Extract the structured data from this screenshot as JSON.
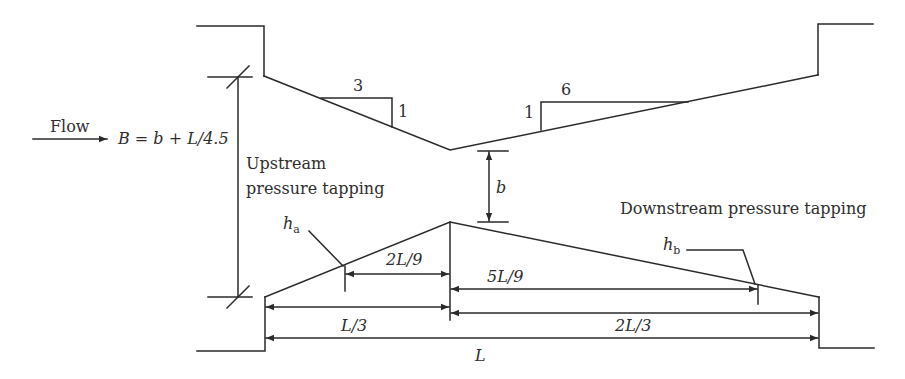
{
  "diagram": {
    "type": "Venturi flume / broad-crested weir profile",
    "stroke_color": "#2a2a2a",
    "text_color": "#2e2e2e",
    "background": "#ffffff"
  },
  "labels": {
    "flow": "Flow",
    "width_formula": "B = b + L/4.5",
    "upstream_line1": "Upstream",
    "upstream_line2": "pressure tapping",
    "downstream": "Downstream pressure tapping",
    "throat_width": "b",
    "ha_main": "h",
    "ha_sub": "a",
    "hb_main": "h",
    "hb_sub": "b"
  },
  "slopes": {
    "upstream": {
      "run": "3",
      "rise": "1"
    },
    "downstream": {
      "run": "6",
      "rise": "1"
    }
  },
  "dimensions": {
    "ha_to_throat": "2L/9",
    "throat_to_hb": "5L/9",
    "upstream_section": "L/3",
    "downstream_section": "2L/3",
    "total_length": "L"
  }
}
